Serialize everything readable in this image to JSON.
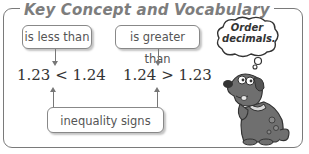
{
  "title": "Key Concept and Vocabulary",
  "labels": {
    "less_than": "is less than",
    "greater_than": "is greater than",
    "inequality_signs": "inequality signs"
  },
  "expressions": {
    "left": "1.23 < 1.24",
    "right": "1.24 > 1.23"
  },
  "thought_bubble": {
    "line1": "Order",
    "line2": "decimals."
  },
  "colors": {
    "border": "#7a7a7a",
    "text": "#555555",
    "dog": "#6f6f6f"
  }
}
